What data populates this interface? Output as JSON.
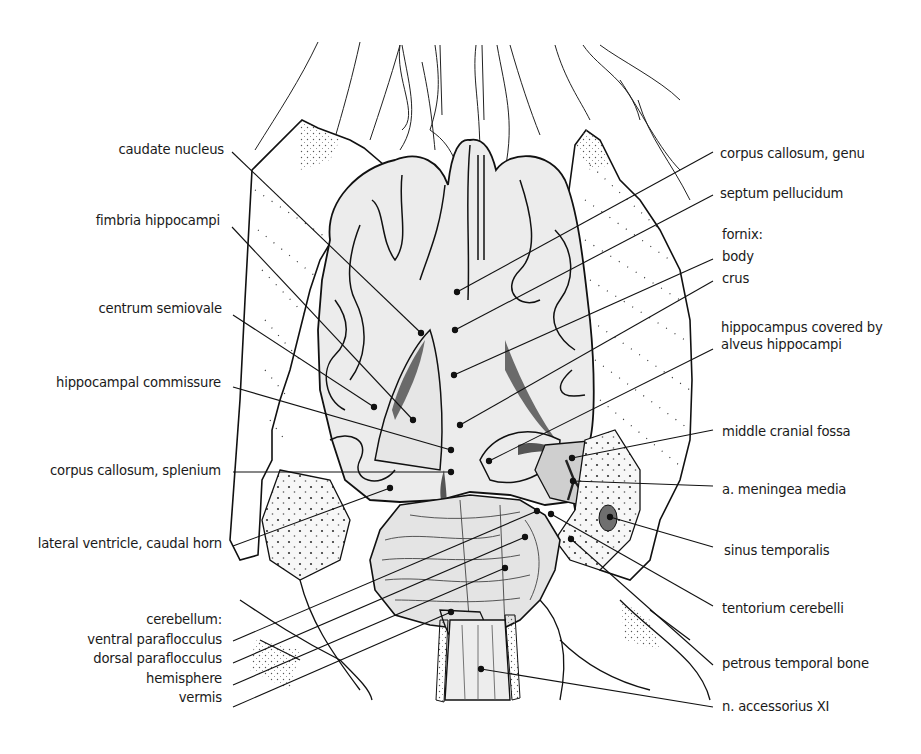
{
  "figure": {
    "colors": {
      "line": "#1a1a1a",
      "brain_fill": "#ececec",
      "fossa_fill": "#cfcfcf",
      "dark_fill": "#777777",
      "stipple": "#333333"
    }
  },
  "labels_left": [
    {
      "id": "caudate-nucleus",
      "text": "caudate nucleus",
      "right": 224,
      "y": 150,
      "line": [
        232,
        152,
        421,
        333
      ]
    },
    {
      "id": "fimbria-hippocampi",
      "text": "fimbria hippocampi",
      "right": 220,
      "y": 221,
      "line": [
        232,
        227,
        413,
        420
      ]
    },
    {
      "id": "centrum-semiovale",
      "text": "centrum semiovale",
      "right": 222,
      "y": 309,
      "line": [
        233,
        315,
        374,
        407
      ]
    },
    {
      "id": "hippocampal-commissure",
      "text": "hippocampal commissure",
      "right": 221,
      "y": 383,
      "line": [
        233,
        387,
        451,
        450
      ]
    },
    {
      "id": "corpus-callosum-splenium",
      "text": "corpus callosum, splenium",
      "right": 221,
      "y": 462,
      "line": [
        233,
        472,
        451,
        472
      ]
    },
    {
      "id": "lateral-ventricle-caudal-horn",
      "text": "lateral ventricle, caudal horn",
      "right": 222,
      "y": 535,
      "line": [
        233,
        546,
        390,
        488
      ]
    }
  ],
  "cerebellum_group": {
    "heading": "cerebellum:",
    "right": 222,
    "y": 617,
    "items": [
      {
        "id": "ventral-paraflocculus",
        "text": "ventral paraflocculus",
        "line": [
          233,
          641,
          537,
          511
        ]
      },
      {
        "id": "dorsal-paraflocculus",
        "text": "dorsal paraflocculus",
        "line": [
          233,
          663,
          525,
          537
        ]
      },
      {
        "id": "hemisphere",
        "text": "hemisphere",
        "line": [
          233,
          685,
          505,
          568
        ]
      },
      {
        "id": "vermis",
        "text": "vermis",
        "line": [
          233,
          707,
          451,
          612
        ]
      }
    ]
  },
  "labels_right": [
    {
      "id": "corpus-callosum-genu",
      "text": "corpus callosum, genu",
      "left": 720,
      "y": 145,
      "line": [
        713,
        152,
        457,
        292
      ]
    },
    {
      "id": "septum-pellucidum",
      "text": "septum pellucidum",
      "left": 720,
      "y": 185,
      "line": [
        713,
        195,
        455,
        330
      ]
    },
    {
      "id": "fornix-body",
      "text": "body",
      "left": 722,
      "y": 249,
      "line": [
        713,
        259,
        454,
        375
      ]
    },
    {
      "id": "fornix-crus",
      "text": "crus",
      "left": 722,
      "y": 271,
      "line": [
        713,
        281,
        460,
        425
      ]
    },
    {
      "id": "hippocampus-covered-by-alveus-hippocampi",
      "text": "hippocampus covered by\nalveus hippocampi",
      "left": 721,
      "y": 319,
      "line": [
        713,
        349,
        489,
        461
      ]
    },
    {
      "id": "middle-cranial-fossa",
      "text": "middle cranial fossa",
      "left": 722,
      "y": 424,
      "line": [
        713,
        430,
        572,
        458
      ]
    },
    {
      "id": "a-meningea-media",
      "text": "a. meningea media",
      "left": 722,
      "y": 482,
      "line": [
        713,
        486,
        573,
        481
      ]
    },
    {
      "id": "sinus-temporalis",
      "text": "sinus temporalis",
      "left": 724,
      "y": 544,
      "line": [
        713,
        547,
        610,
        517
      ]
    },
    {
      "id": "tentorium-cerebelli",
      "text": "tentorium cerebelli",
      "left": 722,
      "y": 602,
      "line": [
        713,
        606,
        551,
        514
      ]
    },
    {
      "id": "petrous-temporal-bone",
      "text": "petrous temporal bone",
      "left": 722,
      "y": 655,
      "line": [
        713,
        665,
        571,
        539
      ]
    },
    {
      "id": "n-accessorius-xi",
      "text": "n. accessorius XI",
      "left": 722,
      "y": 699,
      "line": [
        713,
        707,
        481,
        669
      ]
    }
  ],
  "fornix_heading": {
    "text": "fornix:",
    "left": 722,
    "y": 227
  }
}
